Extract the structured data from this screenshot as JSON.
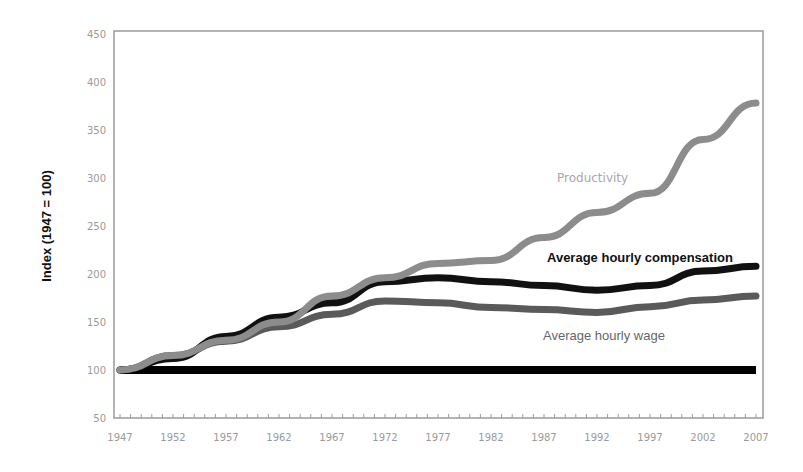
{
  "chart_data": {
    "type": "line",
    "title": "",
    "xlabel": "",
    "ylabel": "Index (1947 = 100)",
    "ylim": [
      50,
      450
    ],
    "yticks": [
      50,
      100,
      150,
      200,
      250,
      300,
      350,
      400,
      450
    ],
    "xlim": [
      1947,
      2007
    ],
    "xticks": [
      1947,
      1952,
      1957,
      1962,
      1967,
      1972,
      1977,
      1982,
      1987,
      1992,
      1997,
      2002,
      2007
    ],
    "grid": false,
    "legend_position": "inline annotations",
    "x": [
      1947,
      1952,
      1957,
      1962,
      1967,
      1972,
      1977,
      1982,
      1987,
      1992,
      1997,
      2002,
      2007
    ],
    "series": [
      {
        "name": "Productivity",
        "color": "#8c8c8c",
        "values": [
          100,
          115,
          131,
          150,
          177,
          196,
          211,
          214,
          238,
          264,
          284,
          340,
          378
        ]
      },
      {
        "name": "Average hourly compensation",
        "color": "#111111",
        "values": [
          100,
          112,
          135,
          155,
          170,
          192,
          196,
          192,
          188,
          183,
          188,
          203,
          208
        ]
      },
      {
        "name": "Average hourly wage",
        "color": "#5a5a5a",
        "values": [
          100,
          115,
          130,
          145,
          158,
          172,
          170,
          165,
          163,
          160,
          166,
          173,
          177
        ]
      },
      {
        "name": "Baseline (1947 = 100)",
        "color": "#000000",
        "values": [
          100,
          100,
          100,
          100,
          100,
          100,
          100,
          100,
          100,
          100,
          100,
          100,
          100
        ]
      }
    ],
    "annotations": [
      {
        "text": "Productivity",
        "x": 1990,
        "y": 272
      },
      {
        "text": "Average hourly compensation",
        "x": 1989,
        "y": 215
      },
      {
        "text": "Average hourly wage",
        "x": 1989,
        "y": 141
      }
    ]
  }
}
